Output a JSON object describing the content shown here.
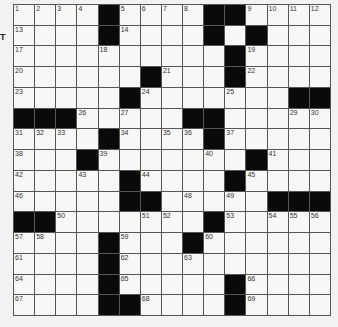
{
  "puzzle": {
    "rows": 15,
    "cols": 15,
    "edge_glyph": "T",
    "colors": {
      "black": "#0a0a0a",
      "white": "#f7f7f5",
      "line": "#555555",
      "background": "#f2f2f2"
    },
    "layout": [
      "....#....##....",
      "....#....#.#...",
      "..........#....",
      "......#...#....",
      ".....#.......##",
      "###.....##.....",
      "....#....#.....",
      "...#.......#...",
      ".....#....#....",
      ".....##.....###",
      "##.......#.....",
      "....#...#......",
      "....#..........",
      "....#.....#....",
      "....##....#...."
    ],
    "numbers": [
      {
        "n": 1,
        "r": 0,
        "c": 0
      },
      {
        "n": 2,
        "r": 0,
        "c": 1
      },
      {
        "n": 3,
        "r": 0,
        "c": 2
      },
      {
        "n": 4,
        "r": 0,
        "c": 3
      },
      {
        "n": 5,
        "r": 0,
        "c": 5
      },
      {
        "n": 6,
        "r": 0,
        "c": 6
      },
      {
        "n": 7,
        "r": 0,
        "c": 7
      },
      {
        "n": 8,
        "r": 0,
        "c": 8
      },
      {
        "n": 9,
        "r": 0,
        "c": 11
      },
      {
        "n": 10,
        "r": 0,
        "c": 12
      },
      {
        "n": 11,
        "r": 0,
        "c": 13
      },
      {
        "n": 12,
        "r": 0,
        "c": 14
      },
      {
        "n": 13,
        "r": 1,
        "c": 0
      },
      {
        "n": 14,
        "r": 1,
        "c": 5
      },
      {
        "n": 15,
        "r": 1,
        "c": 9
      },
      {
        "n": 16,
        "r": 1,
        "c": 11
      },
      {
        "n": 17,
        "r": 2,
        "c": 0
      },
      {
        "n": 18,
        "r": 2,
        "c": 4
      },
      {
        "n": 19,
        "r": 2,
        "c": 11
      },
      {
        "n": 20,
        "r": 3,
        "c": 0
      },
      {
        "n": 21,
        "r": 3,
        "c": 7
      },
      {
        "n": 22,
        "r": 3,
        "c": 11
      },
      {
        "n": 23,
        "r": 4,
        "c": 0
      },
      {
        "n": 24,
        "r": 4,
        "c": 6
      },
      {
        "n": 25,
        "r": 4,
        "c": 10
      },
      {
        "n": 26,
        "r": 5,
        "c": 3
      },
      {
        "n": 27,
        "r": 5,
        "c": 5
      },
      {
        "n": 28,
        "r": 5,
        "c": 9
      },
      {
        "n": 29,
        "r": 5,
        "c": 13
      },
      {
        "n": 30,
        "r": 5,
        "c": 14
      },
      {
        "n": 31,
        "r": 6,
        "c": 0
      },
      {
        "n": 32,
        "r": 6,
        "c": 1
      },
      {
        "n": 33,
        "r": 6,
        "c": 2
      },
      {
        "n": 34,
        "r": 6,
        "c": 5
      },
      {
        "n": 35,
        "r": 6,
        "c": 7
      },
      {
        "n": 36,
        "r": 6,
        "c": 8
      },
      {
        "n": 37,
        "r": 6,
        "c": 10
      },
      {
        "n": 38,
        "r": 7,
        "c": 0
      },
      {
        "n": 39,
        "r": 7,
        "c": 4
      },
      {
        "n": 40,
        "r": 7,
        "c": 9
      },
      {
        "n": 41,
        "r": 7,
        "c": 12
      },
      {
        "n": 42,
        "r": 8,
        "c": 0
      },
      {
        "n": 43,
        "r": 8,
        "c": 3
      },
      {
        "n": 44,
        "r": 8,
        "c": 6
      },
      {
        "n": 45,
        "r": 8,
        "c": 11
      },
      {
        "n": 46,
        "r": 9,
        "c": 0
      },
      {
        "n": 47,
        "r": 9,
        "c": 5
      },
      {
        "n": 48,
        "r": 9,
        "c": 8
      },
      {
        "n": 49,
        "r": 9,
        "c": 10
      },
      {
        "n": 50,
        "r": 10,
        "c": 2
      },
      {
        "n": 51,
        "r": 10,
        "c": 6
      },
      {
        "n": 52,
        "r": 10,
        "c": 7
      },
      {
        "n": 53,
        "r": 10,
        "c": 10
      },
      {
        "n": 54,
        "r": 10,
        "c": 12
      },
      {
        "n": 55,
        "r": 10,
        "c": 13
      },
      {
        "n": 56,
        "r": 10,
        "c": 14
      },
      {
        "n": 57,
        "r": 11,
        "c": 0
      },
      {
        "n": 58,
        "r": 11,
        "c": 1
      },
      {
        "n": 59,
        "r": 11,
        "c": 5
      },
      {
        "n": 60,
        "r": 11,
        "c": 9
      },
      {
        "n": 61,
        "r": 12,
        "c": 0
      },
      {
        "n": 62,
        "r": 12,
        "c": 5
      },
      {
        "n": 63,
        "r": 12,
        "c": 8
      },
      {
        "n": 64,
        "r": 13,
        "c": 0
      },
      {
        "n": 65,
        "r": 13,
        "c": 5
      },
      {
        "n": 66,
        "r": 13,
        "c": 11
      },
      {
        "n": 67,
        "r": 14,
        "c": 0
      },
      {
        "n": 68,
        "r": 14,
        "c": 6
      },
      {
        "n": 69,
        "r": 14,
        "c": 11
      }
    ]
  }
}
